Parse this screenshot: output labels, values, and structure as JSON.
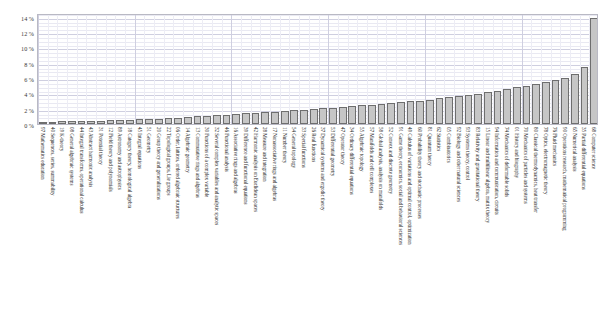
{
  "chart_data": {
    "type": "bar",
    "title": "",
    "xlabel": "",
    "ylabel": "",
    "ylim": [
      0,
      14.5
    ],
    "grid": true,
    "legend": "none",
    "y_ticks": [
      "0 %",
      "2 %",
      "4 %",
      "6 %",
      "8 %",
      "10 %",
      "12 %",
      "14 %"
    ],
    "y_tick_values": [
      0,
      2,
      4,
      6,
      8,
      10,
      12,
      14
    ],
    "categories": [
      "97 Mathematics education",
      "40 Sequences, series, summability",
      "19 K-theory",
      "08 General algebraic systems",
      "44 Integral transforms, operational calculus",
      "43 Abstract harmonic analysis",
      "31 Potential theory",
      "12 Field theory and polynomials",
      "89 Astronomy and astrophysics",
      "18 Category theory, homological algebra",
      "45 Integral equations",
      "51 Geometry",
      "20 Group theory and generalizations",
      "22 Topological groups, Lie groups",
      "06 Order, lattices, ordered algebraic structures",
      "14 Algebraic geometry",
      "13 Commutative rings and algebras",
      "30 Functions of a complex variable",
      "32 Several complex variables and analytic spaces",
      "46 Functional analysis",
      "16 Associative rings and algebras",
      "39 Difference and functional equations",
      "42 Harmonic analysis on Euclidean spaces",
      "28 Measure and integration",
      "17 Nonassociative rings and algebras",
      "11 Number theory",
      "54 General topology",
      "33 Special functions",
      "26 Real functions",
      "37 Dynamical systems and ergodic theory",
      "53 Differential geometry",
      "47 Operator theory",
      "34 Ordinary differential equations",
      "55 Algebraic topology",
      "57 Manifolds and cell complexes",
      "58 Global analysis, analysis on manifolds",
      "52 Convex and discrete geometry",
      "91 Game theory, economics, social and behavioral sciences",
      "49 Calculus of variations and optimal control, optimization",
      "60 Probability theory and stochastic processes",
      "81 Quantum theory",
      "62 Statistics",
      "05 Combinatorics",
      "92 Biology and other natural sciences",
      "93 Systems theory, control",
      "83 Relativity and gravitational theory",
      "15 Linear and multilinear algebra, matrix theory",
      "94 Information and communication, circuits",
      "74 Mechanics of deformable solids",
      "01 History and biography",
      "70 Mechanics of particles and systems",
      "80 Classical thermodynamics, heat transfer",
      "78 Optics, electromagnetic theory",
      "76 Fluid mechanics",
      "90 Operations research, mathematical programming",
      "65 Numerical analysis",
      "35 Partial differential equations",
      "68 Computer science"
    ],
    "values": [
      0.28,
      0.3,
      0.33,
      0.35,
      0.38,
      0.41,
      0.44,
      0.47,
      0.5,
      0.55,
      0.6,
      0.66,
      0.72,
      0.78,
      0.85,
      0.92,
      1.0,
      1.08,
      1.15,
      1.22,
      1.3,
      1.38,
      1.46,
      1.55,
      1.62,
      1.7,
      1.78,
      1.86,
      1.95,
      2.05,
      2.15,
      2.25,
      2.35,
      2.45,
      2.52,
      2.62,
      2.72,
      2.85,
      2.95,
      3.05,
      3.18,
      3.35,
      3.48,
      3.62,
      3.8,
      3.95,
      4.15,
      4.35,
      4.55,
      4.78,
      5.0,
      5.2,
      5.45,
      5.7,
      6.05,
      6.5,
      7.4,
      13.8
    ]
  }
}
